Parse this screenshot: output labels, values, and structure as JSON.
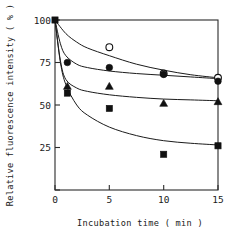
{
  "chart_data": {
    "type": "scatter",
    "title": "",
    "xlabel": "Incubation time ( min )",
    "ylabel": "Relative fluorescence intensity ( % )",
    "xlim": [
      0,
      15
    ],
    "ylim": [
      0,
      100
    ],
    "xticks": [
      0,
      5,
      10,
      15
    ],
    "yticks": [
      0,
      25,
      50,
      75,
      100
    ],
    "xtick_labels": [
      "0",
      "5",
      "10",
      "15"
    ],
    "ytick_labels": [
      "0",
      "25",
      "50",
      "75",
      "100"
    ],
    "grid": false,
    "legend": "none",
    "frame": "box",
    "series": [
      {
        "name": "open-circle",
        "marker": "open-circle",
        "x": [
          0,
          5,
          10,
          15
        ],
        "y": [
          100,
          84,
          68.5,
          66
        ],
        "fit_curve": [
          [
            0,
            100
          ],
          [
            1,
            92
          ],
          [
            2,
            87
          ],
          [
            3,
            83.5
          ],
          [
            5,
            79
          ],
          [
            7.5,
            74
          ],
          [
            10,
            70.5
          ],
          [
            12.5,
            67.8
          ],
          [
            15,
            66
          ]
        ]
      },
      {
        "name": "filled-circle",
        "marker": "filled-circle",
        "x": [
          0,
          1,
          5,
          10,
          15
        ],
        "y": [
          100,
          75,
          72,
          68,
          64
        ],
        "fit_curve": [
          [
            0,
            100
          ],
          [
            0.5,
            86
          ],
          [
            1,
            79
          ],
          [
            2,
            74
          ],
          [
            3,
            72
          ],
          [
            5,
            70
          ],
          [
            7.5,
            68.5
          ],
          [
            10,
            67.5
          ],
          [
            12.5,
            66.5
          ],
          [
            15,
            65.5
          ]
        ]
      },
      {
        "name": "filled-triangle",
        "marker": "filled-triangle",
        "x": [
          0,
          1,
          5,
          10,
          15
        ],
        "y": [
          100,
          61,
          61,
          51,
          52
        ],
        "fit_curve": [
          [
            0,
            100
          ],
          [
            0.5,
            76
          ],
          [
            1,
            65
          ],
          [
            2,
            60
          ],
          [
            3,
            58
          ],
          [
            5,
            56
          ],
          [
            7.5,
            54.5
          ],
          [
            10,
            53.5
          ],
          [
            12.5,
            53
          ],
          [
            15,
            52.5
          ]
        ]
      },
      {
        "name": "filled-square",
        "marker": "filled-square",
        "x": [
          0,
          1,
          5,
          10,
          15
        ],
        "y": [
          100,
          57,
          48,
          21,
          26
        ],
        "fit_curve": [
          [
            0,
            100
          ],
          [
            0.5,
            75
          ],
          [
            1,
            62
          ],
          [
            2,
            50
          ],
          [
            3,
            44
          ],
          [
            5,
            37
          ],
          [
            7.5,
            32
          ],
          [
            10,
            29
          ],
          [
            12.5,
            27.5
          ],
          [
            15,
            26.5
          ]
        ]
      }
    ]
  },
  "axes": {
    "x_title": "Incubation time ( min )",
    "y_title": "Relative fluorescence intensity ( % )"
  }
}
